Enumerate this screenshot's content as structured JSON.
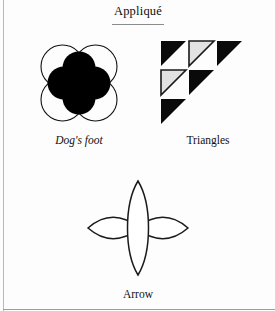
{
  "page": {
    "title": "Appliqué",
    "background_color": "#fdfdfd",
    "ink_color": "#111111"
  },
  "figures": [
    {
      "id": "dogs-foot",
      "caption": "Dog's foot",
      "caption_style": "italic",
      "description": "Four overlapping outlined circles in a 2x2 arrangement with a solid black four-lobed clover shape centered on top",
      "shapes": {
        "outline_circles": 4,
        "solid_lobes": 4,
        "outline_color": "#111111",
        "fill_color": "#000000"
      }
    },
    {
      "id": "triangles",
      "caption": "Triangles",
      "caption_style": "normal",
      "description": "Staircase arrangement of six right triangles with the right angle at the upper-left",
      "grid": [
        [
          "solid",
          "light",
          "solid"
        ],
        [
          "light",
          "solid",
          "empty"
        ],
        [
          "solid",
          "empty",
          "empty"
        ]
      ],
      "solid_color": "#0a0a0a",
      "light_fill_color": "#e2e2e2",
      "light_stroke_color": "#1a1a1a"
    },
    {
      "id": "arrow",
      "caption": "Arrow",
      "caption_style": "normal",
      "description": "Cross of four pointed lens-shaped petals, the vertical pair longer than the horizontal pair, outlined only",
      "shapes": {
        "petals": 4,
        "fill_color": "none",
        "outline_color": "#1a1a1a"
      }
    }
  ]
}
